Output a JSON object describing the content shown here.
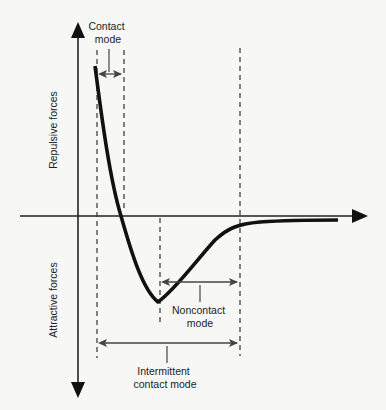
{
  "diagram": {
    "type": "force-distance curve (AFM operating modes)",
    "y_axis": {
      "positive_label": "Repulsive forces",
      "negative_label": "Attractive forces"
    },
    "x_axis": {
      "label": ""
    },
    "regions": [
      {
        "id": "contact",
        "label_line1": "Contact",
        "label_line2": "mode"
      },
      {
        "id": "noncontact",
        "label_line1": "Noncontact",
        "label_line2": "mode"
      },
      {
        "id": "intermittent",
        "label_line1": "Intermittent",
        "label_line2": "contact mode"
      }
    ],
    "colors": {
      "curve": "#111111",
      "axes": "#222222",
      "dashed": "#333333",
      "arrows": "#444444",
      "background": "#f7f7f5"
    }
  }
}
